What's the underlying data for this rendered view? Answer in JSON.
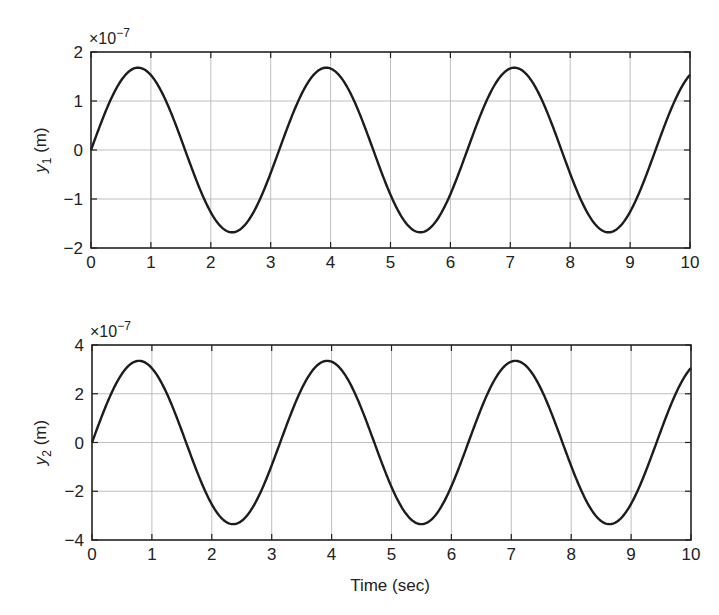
{
  "figure": {
    "xlabel": "Time (sec)"
  },
  "chart_data": [
    {
      "type": "line",
      "title": "",
      "xlabel": "",
      "ylabel": "y1 (m)",
      "ylabel_main": "y",
      "ylabel_sub": "1",
      "ylabel_unit": " (m)",
      "y_multiplier": "×10",
      "y_multiplier_exp": "−7",
      "xlim": [
        0,
        10
      ],
      "ylim": [
        -2,
        2
      ],
      "xticks": [
        "0",
        "1",
        "2",
        "3",
        "4",
        "5",
        "6",
        "7",
        "8",
        "9",
        "10"
      ],
      "yticks": [
        "−2",
        "−1",
        "0",
        "1",
        "2"
      ],
      "ytick_values": [
        -2,
        -1,
        0,
        1,
        2
      ],
      "grid": true,
      "series": [
        {
          "name": "y1",
          "description": "Sinusoid approx 1.68e-7 * sin(2t)",
          "amplitude": 1.68,
          "omega": 2.0,
          "x": [
            0,
            0.5,
            0.785,
            1.0,
            1.5,
            2.0,
            2.356,
            2.5,
            3.0,
            3.5,
            3.927,
            4.0,
            4.5,
            5.0,
            5.498,
            6.0,
            6.5,
            7.069,
            7.5,
            8.0,
            8.5,
            8.639,
            9.0,
            9.5,
            10.0
          ],
          "values": [
            0,
            1.41,
            1.68,
            1.53,
            0.24,
            -1.27,
            -1.68,
            -1.61,
            -0.47,
            1.1,
            1.68,
            1.66,
            0.69,
            -0.91,
            -1.68,
            -0.9,
            1.41,
            1.68,
            1.09,
            -0.48,
            -1.61,
            -1.68,
            -1.27,
            0.25,
            1.53
          ]
        }
      ]
    },
    {
      "type": "line",
      "title": "",
      "xlabel": "Time (sec)",
      "ylabel": "y2 (m)",
      "ylabel_main": "y",
      "ylabel_sub": "2",
      "ylabel_unit": " (m)",
      "y_multiplier": "×10",
      "y_multiplier_exp": "−7",
      "xlim": [
        0,
        10
      ],
      "ylim": [
        -4,
        4
      ],
      "xticks": [
        "0",
        "1",
        "2",
        "3",
        "4",
        "5",
        "6",
        "7",
        "8",
        "9",
        "10"
      ],
      "yticks": [
        "−4",
        "−2",
        "0",
        "2",
        "4"
      ],
      "ytick_values": [
        -4,
        -2,
        0,
        2,
        4
      ],
      "grid": true,
      "series": [
        {
          "name": "y2",
          "description": "Sinusoid approx 3.35e-7 * sin(2t)",
          "amplitude": 3.35,
          "omega": 2.0,
          "x": [
            0,
            0.5,
            0.785,
            1.0,
            1.5,
            2.0,
            2.356,
            2.5,
            3.0,
            3.5,
            3.927,
            4.0,
            4.5,
            5.0,
            5.498,
            6.0,
            6.5,
            7.069,
            7.5,
            8.0,
            8.5,
            8.639,
            9.0,
            9.5,
            10.0
          ],
          "values": [
            0,
            2.82,
            3.35,
            3.05,
            0.47,
            -2.54,
            -3.35,
            -3.21,
            -0.94,
            2.2,
            3.35,
            3.31,
            1.38,
            -1.82,
            -3.35,
            -1.8,
            2.82,
            3.35,
            2.18,
            -0.96,
            -3.22,
            -3.35,
            -2.53,
            0.5,
            3.05
          ]
        }
      ]
    }
  ]
}
